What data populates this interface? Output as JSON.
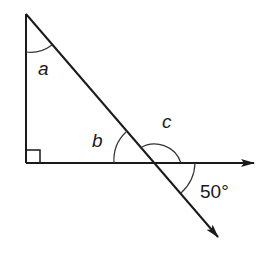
{
  "diagram": {
    "type": "geometry",
    "labels": {
      "angle_a": "a",
      "angle_b": "b",
      "angle_c": "c",
      "given_angle": "50°"
    },
    "points": {
      "top_vertex": [
        26,
        14
      ],
      "right_angle_vertex": [
        26,
        163
      ],
      "intersection": [
        153,
        163
      ],
      "horizontal_arrow_tip": [
        254,
        163
      ],
      "diagonal_arrow_tip": [
        218,
        237
      ]
    },
    "colors": {
      "stroke": "#1a1a1a",
      "arc": "#333333",
      "background": "#ffffff"
    }
  }
}
